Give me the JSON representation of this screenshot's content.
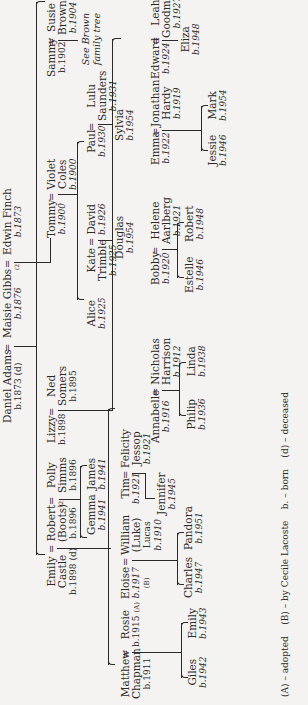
{
  "tree": {
    "gen1": {
      "daniel": {
        "name": "Daniel Adams",
        "birth": "b.1873 (d)"
      },
      "maisie": {
        "name": "Maisie Gibbs",
        "birth": "b.1876"
      },
      "edwin": {
        "name": "Edwin Finch",
        "birth": "b.1873"
      },
      "second_marriage_mark": "(2)"
    },
    "gen2": {
      "emily_castle": {
        "name": "Emily",
        "surname": "Castle",
        "birth": "b.1898 (d)"
      },
      "robert": {
        "name": "Robert",
        "nickname": "(Boots)",
        "birth": "b.1896"
      },
      "polly": {
        "name": "Polly",
        "surname": "Simms",
        "birth": "b.1896"
      },
      "lizzy": {
        "name": "Lizzy",
        "birth": "b.1898"
      },
      "ned": {
        "name": "Ned",
        "surname": "Somers",
        "birth": "b.1895"
      },
      "tommy": {
        "name": "Tommy",
        "birth": "b.1900"
      },
      "violet": {
        "name": "Violet",
        "surname": "Coles",
        "birth": "b.1900"
      },
      "sammy": {
        "name": "Sammy",
        "birth": "b.1902"
      },
      "susie": {
        "name": "Susie",
        "surname": "Brown",
        "birth": "b.1904"
      },
      "second_marriage_mark": "(2)"
    },
    "gen3": {
      "matthew": {
        "name": "Matthew",
        "surname": "Chapman",
        "birth": "b.1911"
      },
      "rosie": {
        "name": "Rosie",
        "birth": "b.1915",
        "mark": "(A)"
      },
      "eloise": {
        "name": "Eloise",
        "birth": "b.1917",
        "mark": "(B)"
      },
      "william": {
        "name": "William",
        "nickname": "(Luke)",
        "surname": "Lucas",
        "birth": "b.1910"
      },
      "gemma": {
        "name": "Gemma",
        "birth": "b.1941"
      },
      "james": {
        "name": "James",
        "birth": "b.1941"
      },
      "tim": {
        "name": "Tim",
        "birth": "b.1921"
      },
      "felicity": {
        "name": "Felicity",
        "surname": "Jessop",
        "birth": "b.1921"
      },
      "annabelle": {
        "name": "Annabelle",
        "birth": "b.1916"
      },
      "nicholas": {
        "name": "Nicholas",
        "surname": "Harrison",
        "birth": "b.1912"
      },
      "bobby": {
        "name": "Bobby",
        "birth": "b.1920"
      },
      "helene": {
        "name": "Helene",
        "surname": "Aarlberg",
        "birth": "b.1921"
      },
      "emma": {
        "name": "Emma",
        "birth": "b.1922"
      },
      "jonathan": {
        "name": "Jonathan",
        "surname": "Hardy",
        "birth": "b.1919"
      },
      "edward": {
        "name": "Edward",
        "birth": "b.1924"
      },
      "leah": {
        "name": "Leah",
        "surname": "Goodman",
        "birth": "b.1927"
      },
      "alice": {
        "name": "Alice",
        "birth": "b.1925"
      },
      "kate": {
        "name": "Kate",
        "surname": "Trimble",
        "birth": "b.1925"
      },
      "david": {
        "name": "David",
        "birth": "b.1926"
      },
      "paul": {
        "name": "Paul",
        "birth": "b.1930"
      },
      "lulu": {
        "name": "Lulu",
        "surname": "Saunders",
        "birth": "b.1931"
      },
      "see_brown": "See Brown family tree"
    },
    "gen4": {
      "giles": {
        "name": "Giles",
        "birth": "b.1942"
      },
      "emily": {
        "name": "Emily",
        "birth": "b.1943"
      },
      "jennifer": {
        "name": "Jennifer",
        "birth": "b.1945"
      },
      "charles": {
        "name": "Charles",
        "birth": "b.1947"
      },
      "pandora": {
        "name": "Pandora",
        "birth": "b.1951"
      },
      "philip": {
        "name": "Philip",
        "birth": "b.1936"
      },
      "linda": {
        "name": "Linda",
        "birth": "b.1938"
      },
      "estelle": {
        "name": "Estelle",
        "birth": "b.1946"
      },
      "robert": {
        "name": "Robert",
        "birth": "b.1948"
      },
      "jessie": {
        "name": "Jessie",
        "birth": "b.1946"
      },
      "mark": {
        "name": "Mark",
        "birth": "b.1954"
      },
      "eliza": {
        "name": "Eliza",
        "birth": "b.1948"
      },
      "douglas": {
        "name": "Douglas",
        "birth": "b.1954"
      },
      "sylvia": {
        "name": "Sylvia",
        "birth": "b.1954"
      }
    },
    "marriage_symbol": "="
  },
  "legend": {
    "adopted": "(A) – adopted",
    "by_cecile": "(B) – by Cecile Lacoste",
    "born": "b. – born",
    "deceased": "(d) – deceased"
  }
}
